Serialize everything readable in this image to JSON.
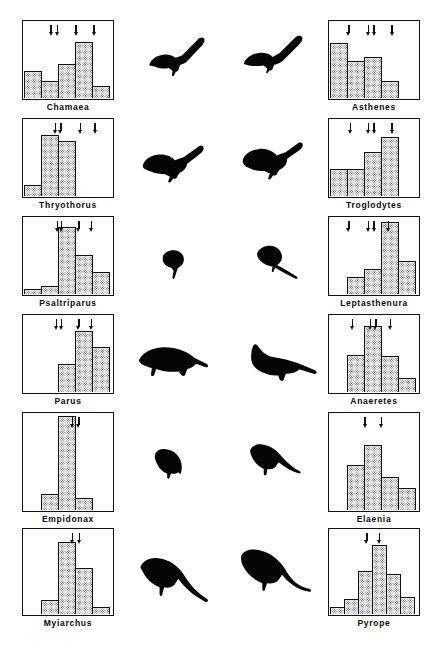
{
  "figure": {
    "type": "comparative-histogram-plate",
    "columns": 2,
    "rows": 6,
    "bar_fill": "#ffffff stippled",
    "ink_color": "#111111"
  },
  "chart_data": {
    "type": "bar",
    "title": "",
    "xlabel": "",
    "ylabel": "",
    "grid": false,
    "legend": "none",
    "ylim": [
      0,
      100
    ],
    "panels": [
      {
        "id": "chamaea",
        "label": "Chamaea",
        "column": "left",
        "row": 1,
        "categories": [
          "1",
          "2",
          "3",
          "4",
          "5"
        ],
        "values": [
          34,
          22,
          44,
          72,
          16
        ],
        "arrows": [
          31,
          38,
          59,
          79
        ]
      },
      {
        "id": "asthenes",
        "label": "Asthenes",
        "column": "right",
        "row": 1,
        "categories": [
          "1",
          "2",
          "3",
          "4",
          "5"
        ],
        "values": [
          70,
          48,
          52,
          22,
          0
        ],
        "arrows": [
          22,
          44,
          50,
          70
        ]
      },
      {
        "id": "thryothorus",
        "label": "Thryothorus",
        "column": "left",
        "row": 2,
        "categories": [
          "1",
          "2",
          "3",
          "4",
          "5"
        ],
        "values": [
          14,
          78,
          70,
          0,
          0
        ],
        "arrows": [
          36,
          42,
          64,
          80
        ]
      },
      {
        "id": "troglodytes",
        "label": "Troglodytes",
        "column": "right",
        "row": 2,
        "categories": [
          "1",
          "2",
          "3",
          "4",
          "5"
        ],
        "values": [
          34,
          34,
          56,
          76,
          0
        ],
        "arrows": [
          24,
          44,
          50,
          70
        ]
      },
      {
        "id": "psaltriparus",
        "label": "Psaltriparus",
        "column": "left",
        "row": 3,
        "categories": [
          "1",
          "2",
          "3",
          "4",
          "5"
        ],
        "values": [
          6,
          10,
          86,
          50,
          28
        ],
        "arrows": [
          38,
          43,
          62,
          76
        ]
      },
      {
        "id": "leptasthenura",
        "label": "Leptasthenura",
        "column": "right",
        "row": 3,
        "categories": [
          "1",
          "2",
          "3",
          "4",
          "5"
        ],
        "values": [
          0,
          22,
          32,
          92,
          42
        ],
        "arrows": [
          22,
          44,
          50,
          66
        ]
      },
      {
        "id": "parus",
        "label": "Parus",
        "column": "left",
        "row": 4,
        "categories": [
          "1",
          "2",
          "3",
          "4",
          "5"
        ],
        "values": [
          0,
          0,
          36,
          78,
          58
        ],
        "arrows": [
          37,
          43,
          62,
          76
        ]
      },
      {
        "id": "anaeretes",
        "label": "Anaeretes",
        "column": "right",
        "row": 4,
        "categories": [
          "1",
          "2",
          "3",
          "4",
          "5"
        ],
        "values": [
          0,
          48,
          84,
          46,
          18
        ],
        "arrows": [
          26,
          46,
          52,
          68
        ]
      },
      {
        "id": "empidonax",
        "label": "Empidonax",
        "column": "left",
        "row": 5,
        "categories": [
          "1",
          "2",
          "3",
          "4",
          "5"
        ],
        "values": [
          0,
          16,
          96,
          12,
          0
        ],
        "arrows": [
          55,
          62
        ]
      },
      {
        "id": "elaenia",
        "label": "Elaenia",
        "column": "right",
        "row": 5,
        "categories": [
          "1",
          "2",
          "3",
          "4",
          "5"
        ],
        "values": [
          0,
          46,
          66,
          34,
          22
        ],
        "arrows": [
          40,
          58
        ]
      },
      {
        "id": "myiarchus",
        "label": "Myiarchus",
        "column": "left",
        "row": 6,
        "categories": [
          "1",
          "2",
          "3",
          "4",
          "5"
        ],
        "values": [
          0,
          16,
          84,
          54,
          8
        ],
        "arrows": [
          55,
          63
        ]
      },
      {
        "id": "pyrope",
        "label": "Pyrope",
        "column": "right",
        "row": 6,
        "categories": [
          "1",
          "2",
          "3",
          "4",
          "5"
        ],
        "values": [
          8,
          18,
          50,
          80,
          46,
          20
        ],
        "arrows": [
          42,
          56
        ]
      }
    ]
  },
  "silhouettes": [
    {
      "id": "silhouette-chamaea",
      "name": "wrentit-silhouette",
      "row": 1,
      "column": "inner-left"
    },
    {
      "id": "silhouette-asthenes",
      "name": "canastero-silhouette",
      "row": 1,
      "column": "inner-right"
    },
    {
      "id": "silhouette-thryothorus",
      "name": "carolina-wren-silhouette",
      "row": 2,
      "column": "inner-left"
    },
    {
      "id": "silhouette-troglodytes",
      "name": "house-wren-silhouette",
      "row": 2,
      "column": "inner-right"
    },
    {
      "id": "silhouette-psaltriparus",
      "name": "bushtit-silhouette",
      "row": 3,
      "column": "inner-left"
    },
    {
      "id": "silhouette-leptasthenura",
      "name": "tit-spinetail-silhouette",
      "row": 3,
      "column": "inner-right"
    },
    {
      "id": "silhouette-parus",
      "name": "titmouse-silhouette",
      "row": 4,
      "column": "inner-left"
    },
    {
      "id": "silhouette-anaeretes",
      "name": "tit-tyrant-silhouette",
      "row": 4,
      "column": "inner-right"
    },
    {
      "id": "silhouette-empidonax",
      "name": "empidonax-flycatcher-silhouette",
      "row": 5,
      "column": "inner-left"
    },
    {
      "id": "silhouette-elaenia",
      "name": "elaenia-silhouette",
      "row": 5,
      "column": "inner-right"
    },
    {
      "id": "silhouette-myiarchus",
      "name": "myiarchus-flycatcher-silhouette",
      "row": 6,
      "column": "inner-left"
    },
    {
      "id": "silhouette-pyrope",
      "name": "pyrope-flycatcher-silhouette",
      "row": 6,
      "column": "inner-right"
    }
  ]
}
